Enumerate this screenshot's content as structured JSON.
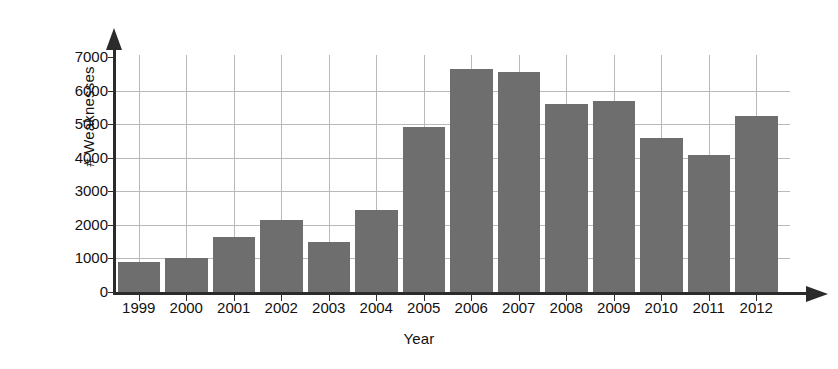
{
  "chart_data": {
    "type": "bar",
    "title": "",
    "xlabel": "Year",
    "ylabel": "# Weaknesses",
    "categories": [
      "1999",
      "2000",
      "2001",
      "2002",
      "2003",
      "2004",
      "2005",
      "2006",
      "2007",
      "2008",
      "2009",
      "2010",
      "2011",
      "2012"
    ],
    "values": [
      890,
      1010,
      1650,
      2130,
      1500,
      2430,
      4920,
      6650,
      6540,
      5590,
      5700,
      4600,
      4070,
      5230
    ],
    "ylim": [
      0,
      7000
    ],
    "yticks": [
      0,
      1000,
      2000,
      3000,
      4000,
      5000,
      6000,
      7000
    ],
    "ytick_labels": [
      "0",
      "1000",
      "2000",
      "3000",
      "4000",
      "5000",
      "6000",
      "7000"
    ],
    "grid": true,
    "legend": false,
    "series_color": "#6e6e6e",
    "axis_color": "#2b2b2b",
    "grid_color": "#b9b9b9"
  }
}
